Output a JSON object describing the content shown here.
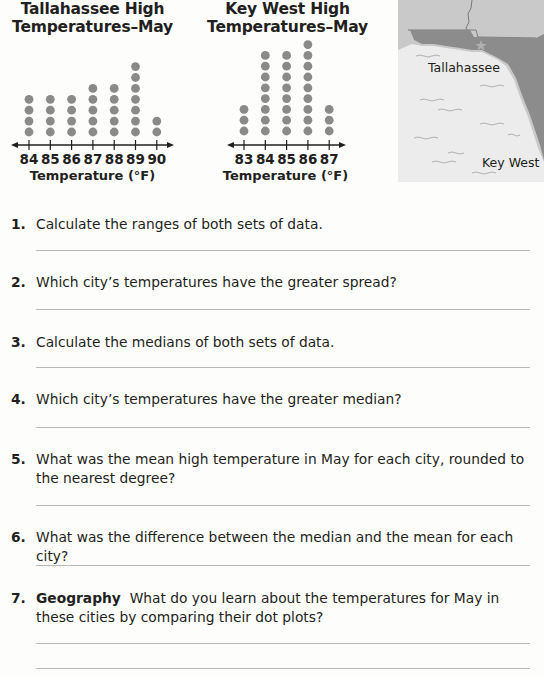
{
  "chart_data": [
    {
      "type": "scatter",
      "subtype": "dot_plot",
      "title": "Tallahassee High Temperatures–May",
      "xlabel": "Temperature (°F)",
      "ylabel": "",
      "categories": [
        84,
        85,
        86,
        87,
        88,
        89,
        90
      ],
      "values": [
        4,
        4,
        4,
        5,
        5,
        7,
        2
      ],
      "xlim": [
        84,
        90
      ],
      "grid": false,
      "dot_color": "#8a8a8a"
    },
    {
      "type": "scatter",
      "subtype": "dot_plot",
      "title": "Key West High Temperatures–May",
      "xlabel": "Temperature (°F)",
      "ylabel": "",
      "categories": [
        83,
        84,
        85,
        86,
        87
      ],
      "values": [
        3,
        8,
        8,
        9,
        3
      ],
      "xlim": [
        83,
        87
      ],
      "grid": false,
      "dot_color": "#8a8a8a"
    }
  ],
  "plots": {
    "tallahassee": {
      "title_line1": "Tallahassee High",
      "title_line2": "Temperatures–May",
      "axis_label": "Temperature (°F)",
      "ticks": [
        "84",
        "85",
        "86",
        "87",
        "88",
        "89",
        "90"
      ]
    },
    "keywest": {
      "title_line1": "Key West High",
      "title_line2": "Temperatures–May",
      "axis_label": "Temperature (°F)",
      "ticks": [
        "83",
        "84",
        "85",
        "86",
        "87"
      ]
    }
  },
  "map": {
    "label_tallahassee": "Tallahassee",
    "label_keywest": "Key West",
    "land_color": "#8c8c8c",
    "state_color": "#c9c9c9",
    "water_color": "#ececec"
  },
  "questions": [
    {
      "num": "1.",
      "text": "Calculate the ranges of both sets of data."
    },
    {
      "num": "2.",
      "text": "Which city’s temperatures have the greater spread?"
    },
    {
      "num": "3.",
      "text": "Calculate the medians of both sets of data."
    },
    {
      "num": "4.",
      "text": "Which city’s temperatures have the greater median?"
    },
    {
      "num": "5.",
      "text": "What was the mean high temperature in May for each city, rounded to the nearest degree?"
    },
    {
      "num": "6.",
      "text": "What was the difference between the median and the mean for each city?"
    },
    {
      "num": "7.",
      "keyword": "Geography",
      "text": "What do you learn about the temperatures for May in these cities by comparing their dot plots?"
    }
  ]
}
